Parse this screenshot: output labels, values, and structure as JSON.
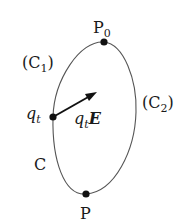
{
  "diagram": {
    "labels": {
      "p0": "P",
      "p0_sub": "0",
      "c1_open": "(C",
      "c1_sub": "1",
      "c1_close": ")",
      "c2_open": "(C",
      "c2_sub": "2",
      "c2_close": ")",
      "qt": "q",
      "qt_sub": "t",
      "force": "q",
      "force_sub": "t",
      "force_vec": "E",
      "c": "C",
      "p": "P"
    },
    "colors": {
      "curve": "#555555",
      "ink": "#1a1a1a"
    }
  }
}
